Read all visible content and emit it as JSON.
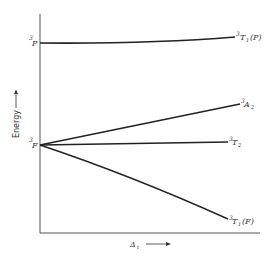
{
  "diagram": {
    "type": "energy-level correlation diagram (d8 / tetrahedral d2 Tanabe-Sugano style)",
    "y_axis_label": "Energy",
    "x_axis_label": "Δt",
    "x_axis_symbol": "Δ",
    "x_axis_subscript": "t",
    "left_terms": [
      {
        "sup": "3",
        "term": "P",
        "y": 43
      },
      {
        "sup": "3",
        "term": "F",
        "y": 145
      }
    ],
    "right_terms": [
      {
        "sup": "3",
        "term": "T",
        "sub": "1",
        "suffix": "(P)",
        "from": "3P",
        "y_end": 37
      },
      {
        "sup": "3",
        "term": "A",
        "sub": "2",
        "suffix": "",
        "from": "3F",
        "y_end": 104
      },
      {
        "sup": "3",
        "term": "T",
        "sub": "2",
        "suffix": "",
        "from": "3F",
        "y_end": 142
      },
      {
        "sup": "3",
        "term": "T",
        "sub": "1",
        "suffix": "(F)",
        "from": "3F",
        "y_end": 219
      }
    ],
    "colors": {
      "line": "#222222",
      "axis": "#555555",
      "text": "#333333"
    }
  }
}
